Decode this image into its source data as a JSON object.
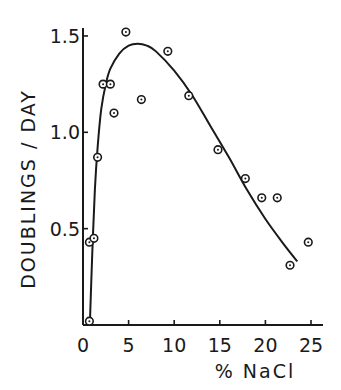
{
  "chart_data": {
    "type": "scatter",
    "title": "",
    "xlabel": "% NaCl",
    "ylabel": "DOUBLINGS / DAY",
    "xlim": [
      0,
      26
    ],
    "ylim": [
      0,
      1.55
    ],
    "x_ticks": [
      0,
      5,
      10,
      15,
      20,
      25
    ],
    "x_tick_labels": [
      "0",
      "5",
      "10",
      "15",
      "20",
      "25"
    ],
    "y_ticks": [
      0.5,
      1.0,
      1.5
    ],
    "y_tick_labels": [
      "0.5",
      "1.0",
      "1.5"
    ],
    "grid": false,
    "legend": null,
    "series": [
      {
        "name": "observed",
        "kind": "points",
        "marker": "circled-dot",
        "x": [
          0.7,
          0.7,
          1.2,
          1.6,
          2.2,
          3.0,
          3.4,
          4.7,
          6.4,
          9.3,
          11.6,
          14.8,
          17.8,
          19.6,
          21.3,
          22.7,
          24.7
        ],
        "y": [
          0.02,
          0.43,
          0.45,
          0.87,
          1.25,
          1.25,
          1.1,
          1.52,
          1.17,
          1.42,
          1.19,
          0.91,
          0.76,
          0.66,
          0.66,
          0.31,
          0.43
        ]
      },
      {
        "name": "fitted curve",
        "kind": "line",
        "x": [
          0.75,
          1.0,
          1.3,
          1.6,
          2.0,
          2.5,
          3.0,
          4.0,
          5.0,
          6.0,
          7.0,
          8.0,
          10.0,
          12.0,
          14.0,
          16.0,
          18.0,
          20.0,
          22.0,
          23.5
        ],
        "y": [
          0.0,
          0.35,
          0.7,
          0.92,
          1.12,
          1.25,
          1.33,
          1.41,
          1.45,
          1.46,
          1.45,
          1.42,
          1.32,
          1.19,
          1.03,
          0.87,
          0.7,
          0.55,
          0.42,
          0.33
        ]
      }
    ]
  }
}
